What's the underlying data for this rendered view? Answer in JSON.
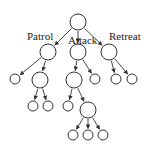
{
  "diagram": {
    "type": "tree",
    "colors": {
      "stroke": "#333333",
      "fill": "#ffffff",
      "text": "#222222"
    },
    "labels": [
      {
        "id": "patrol",
        "text": "Patrol",
        "x": 27,
        "y": 40
      },
      {
        "id": "attack",
        "text": "Attack",
        "x": 68,
        "y": 44
      },
      {
        "id": "retreat",
        "text": "Retreat",
        "x": 109,
        "y": 40
      }
    ],
    "nodes": [
      {
        "id": "root",
        "x": 78,
        "y": 22,
        "r": 8
      },
      {
        "id": "patrol",
        "x": 48,
        "y": 52,
        "r": 8
      },
      {
        "id": "attack",
        "x": 78,
        "y": 52,
        "r": 8
      },
      {
        "id": "retreat",
        "x": 109,
        "y": 52,
        "r": 8
      },
      {
        "id": "p1",
        "x": 15,
        "y": 79,
        "r": 5
      },
      {
        "id": "p2",
        "x": 40,
        "y": 80,
        "r": 8
      },
      {
        "id": "p2a",
        "x": 33,
        "y": 106,
        "r": 5
      },
      {
        "id": "p2b",
        "x": 48,
        "y": 106,
        "r": 5
      },
      {
        "id": "a1",
        "x": 74,
        "y": 80,
        "r": 8
      },
      {
        "id": "a2",
        "x": 95,
        "y": 79,
        "r": 5
      },
      {
        "id": "a1a",
        "x": 68,
        "y": 106,
        "r": 5
      },
      {
        "id": "a1b",
        "x": 88,
        "y": 110,
        "r": 8
      },
      {
        "id": "a1b1",
        "x": 73,
        "y": 135,
        "r": 5
      },
      {
        "id": "a1b2",
        "x": 88,
        "y": 135,
        "r": 5
      },
      {
        "id": "a1b3",
        "x": 103,
        "y": 135,
        "r": 5
      },
      {
        "id": "r1",
        "x": 116,
        "y": 79,
        "r": 5
      },
      {
        "id": "r2",
        "x": 132,
        "y": 79,
        "r": 5
      }
    ],
    "edges": [
      [
        "root",
        "patrol"
      ],
      [
        "root",
        "attack"
      ],
      [
        "root",
        "retreat"
      ],
      [
        "patrol",
        "p1"
      ],
      [
        "patrol",
        "p2"
      ],
      [
        "p2",
        "p2a"
      ],
      [
        "p2",
        "p2b"
      ],
      [
        "attack",
        "a1"
      ],
      [
        "attack",
        "a2"
      ],
      [
        "a1",
        "a1a"
      ],
      [
        "a1",
        "a1b"
      ],
      [
        "a1b",
        "a1b1"
      ],
      [
        "a1b",
        "a1b2"
      ],
      [
        "a1b",
        "a1b3"
      ],
      [
        "retreat",
        "r1"
      ],
      [
        "retreat",
        "r2"
      ]
    ]
  }
}
